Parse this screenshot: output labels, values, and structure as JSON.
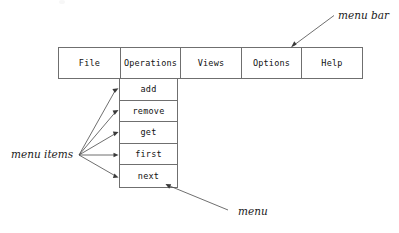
{
  "diagram": {
    "type": "annotated-ui-diagram",
    "colors": {
      "stroke": "#6f6f6f",
      "text": "#111111",
      "arrow": "#4a4a4a",
      "background": "#ffffff"
    }
  },
  "menubar": {
    "name": "menu-bar",
    "items": [
      {
        "label": "File"
      },
      {
        "label": "Operations"
      },
      {
        "label": "Views"
      },
      {
        "label": "Options"
      },
      {
        "label": "Help"
      }
    ]
  },
  "dropdown": {
    "name": "operations-menu",
    "parent": "Operations",
    "items": [
      {
        "label": "add"
      },
      {
        "label": "remove"
      },
      {
        "label": "get"
      },
      {
        "label": "first"
      },
      {
        "label": "next"
      }
    ]
  },
  "annotations": [
    {
      "id": "menu-bar",
      "label": "menu bar"
    },
    {
      "id": "menu-items",
      "label": "menu items"
    },
    {
      "id": "menu",
      "label": "menu"
    }
  ]
}
